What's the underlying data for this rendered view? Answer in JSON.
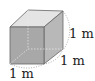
{
  "diagram": {
    "shape": "cube",
    "labels": {
      "height": "1 m",
      "depth": "1 m",
      "width": "1 m"
    },
    "colors": {
      "front_face": "#a9a9a9",
      "top_face": "#e4e4e4",
      "side_face": "#bcbcbc",
      "edge": "#555555"
    }
  }
}
